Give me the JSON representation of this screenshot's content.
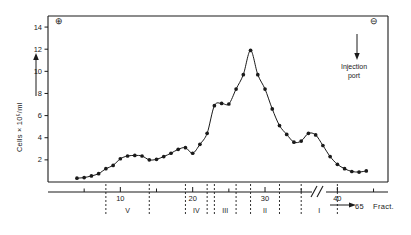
{
  "figure": {
    "polarity_left_symbol": "⊕",
    "polarity_right_symbol": "⊖",
    "injection_annotation_line1": "Injection",
    "injection_annotation_line2": "port",
    "fraction_end_label": "65",
    "fraction_unit_label": "Fract."
  },
  "chart_data": {
    "type": "line",
    "title": "",
    "xlabel": "Fract.",
    "ylabel": "Cells × 10⁵/ml",
    "xlim": [
      0,
      47
    ],
    "ylim": [
      0,
      15
    ],
    "grid": false,
    "legend": null,
    "marker": "filled-circle",
    "y_ticks": [
      2,
      4,
      6,
      8,
      10,
      12,
      14
    ],
    "y_tick_labels": [
      "2",
      "4",
      "6",
      "8",
      "10",
      "12",
      "14"
    ],
    "x_ticks": [
      10,
      20,
      30,
      40
    ],
    "x_tick_labels": [
      "10",
      "20",
      "30",
      "40"
    ],
    "x_minor_tick_step": 5,
    "axis_break_after": 45,
    "bands": [
      {
        "label": "V",
        "start": 8,
        "end": 14
      },
      {
        "label": "IV",
        "start": 19,
        "end": 22
      },
      {
        "label": "III",
        "start": 23,
        "end": 26
      },
      {
        "label": "II",
        "start": 28,
        "end": 32
      },
      {
        "label": "I",
        "start": 35,
        "end": 40
      }
    ],
    "x": [
      4,
      5,
      6,
      7,
      8,
      9,
      10,
      11,
      12,
      13,
      14,
      15,
      16,
      17,
      18,
      19,
      20,
      21,
      22,
      23,
      24,
      25,
      26,
      27,
      28,
      29,
      30,
      31,
      32,
      33,
      34,
      35,
      36,
      37,
      38,
      39,
      40,
      41,
      42,
      43,
      44
    ],
    "values": [
      0.35,
      0.4,
      0.55,
      0.75,
      1.2,
      1.5,
      2.1,
      2.35,
      2.4,
      2.35,
      2.0,
      2.05,
      2.3,
      2.6,
      2.95,
      3.1,
      2.6,
      3.4,
      4.4,
      6.9,
      7.1,
      7.05,
      8.4,
      9.7,
      11.9,
      9.7,
      8.4,
      6.6,
      5.1,
      4.3,
      3.6,
      3.7,
      4.4,
      4.25,
      3.3,
      2.3,
      1.6,
      1.2,
      0.95,
      0.9,
      1.0
    ]
  }
}
